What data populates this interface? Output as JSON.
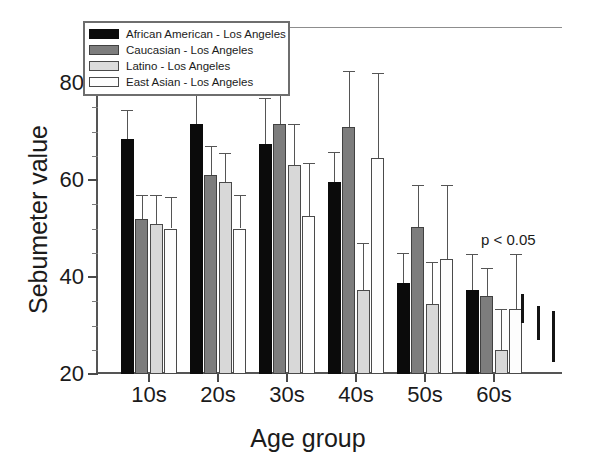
{
  "chart_data": {
    "type": "bar",
    "title": "",
    "xlabel": "Age group",
    "ylabel": "Sebumeter value",
    "categories": [
      "10s",
      "20s",
      "30s",
      "40s",
      "50s",
      "60s"
    ],
    "ylim": [
      20,
      80
    ],
    "y_ticks_major": [
      20,
      40,
      60,
      80
    ],
    "y_tick_labels": [
      "20",
      "40",
      "60",
      "80"
    ],
    "y_ticks_minor": [
      25,
      30,
      35,
      45,
      50,
      55,
      65,
      70,
      75
    ],
    "grid": false,
    "legend_position": "top-left",
    "annotation": "p < 0.05",
    "series": [
      {
        "name": "African American - Los Angeles",
        "color": "#0b0b0b",
        "values": [
          68.5,
          71.5,
          67.5,
          59.5,
          38.8,
          37.3
        ],
        "errors_upper": [
          74.5,
          79.0,
          77.0,
          65.8,
          45.0,
          44.8
        ]
      },
      {
        "name": "Caucasian - Los Angeles",
        "color": "#7d7d7d",
        "values": [
          52.0,
          61.0,
          71.5,
          71.0,
          50.3,
          36.0
        ],
        "errors_upper": [
          57.0,
          67.0,
          78.5,
          82.5,
          59.0,
          41.8
        ]
      },
      {
        "name": "Latino - Los Angeles",
        "color": "#d8d8d8",
        "values": [
          51.0,
          59.5,
          63.0,
          37.3,
          34.5,
          25.0
        ],
        "errors_upper": [
          57.0,
          65.5,
          71.5,
          47.0,
          43.0,
          33.5
        ]
      },
      {
        "name": "East Asian - Los Angeles",
        "color": "#fdfdfd",
        "values": [
          50.0,
          50.0,
          52.5,
          64.5,
          43.8,
          33.3
        ],
        "errors_upper": [
          56.5,
          57.0,
          63.5,
          82.0,
          59.0,
          44.8
        ]
      }
    ],
    "significance_markers": [
      {
        "top_value": 36.5,
        "bottom_value": 30.5
      },
      {
        "top_value": 34.0,
        "bottom_value": 27.0
      },
      {
        "top_value": 33.0,
        "bottom_value": 22.5
      }
    ]
  },
  "legend": {
    "items": [
      {
        "label": "African American - Los Angeles"
      },
      {
        "label": "Caucasian - Los Angeles"
      },
      {
        "label": "Latino - Los Angeles"
      },
      {
        "label": "East Asian - Los Angeles"
      }
    ]
  },
  "axes": {
    "y_title": "Sebumeter value",
    "x_title": "Age group"
  }
}
